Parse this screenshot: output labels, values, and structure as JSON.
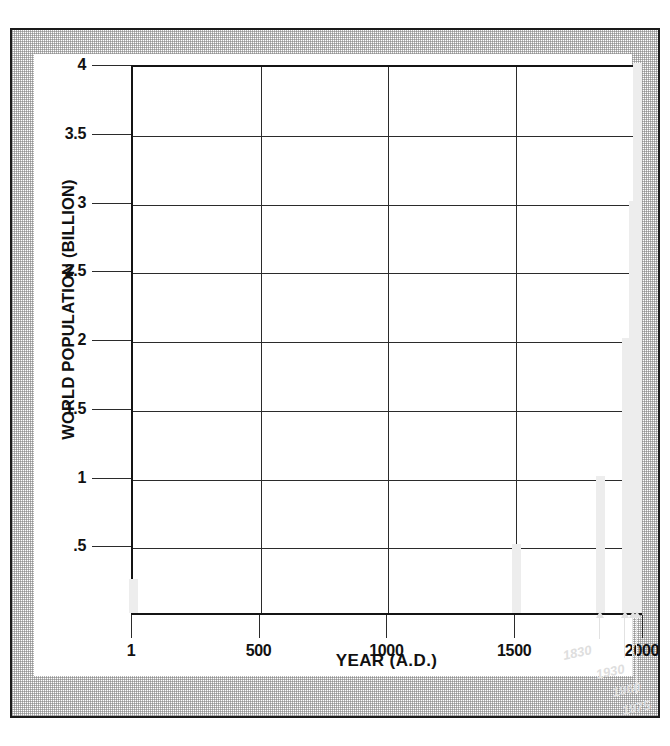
{
  "figure": {
    "alt_title": "World population growth over time"
  },
  "chart_data": {
    "type": "bar",
    "title": "",
    "xlabel": "YEAR (A.D.)",
    "ylabel": "WORLD POPULATION (BILLION)",
    "xlim": [
      1,
      2000
    ],
    "ylim": [
      0,
      4
    ],
    "grid": true,
    "legend": "none",
    "x_ticks": [
      "1",
      "500",
      "1000",
      "1500",
      "2000"
    ],
    "x_tick_values": [
      1,
      500,
      1000,
      1500,
      2000
    ],
    "y_ticks": [
      ".5",
      "1",
      "1.5",
      "2",
      "2.5",
      "3",
      "3.5",
      "4"
    ],
    "y_tick_values": [
      0.5,
      1,
      1.5,
      2,
      2.5,
      3,
      3.5,
      4
    ],
    "categories": [
      1,
      1500,
      1830,
      1930,
      1960,
      1975
    ],
    "values": [
      0.25,
      0.5,
      1,
      2,
      3,
      4
    ],
    "bar_color": "#ededed",
    "axis_color": "#141414",
    "grid_color": "#2b2b2b",
    "bars": [
      {
        "year": 1,
        "label": "",
        "value": 0.25
      },
      {
        "year": 1500,
        "label": "",
        "value": 0.5
      },
      {
        "year": 1830,
        "label": "1830",
        "value": 1
      },
      {
        "year": 1930,
        "label": "1930",
        "value": 2
      },
      {
        "year": 1960,
        "label": "1960",
        "value": 3
      },
      {
        "year": 1975,
        "label": "1975",
        "value": 4
      }
    ],
    "annotations": [
      {
        "text": "1830",
        "year": 1830
      },
      {
        "text": "1930",
        "year": 1930
      },
      {
        "text": "1960",
        "year": 1960
      },
      {
        "text": "1975",
        "year": 1975
      }
    ]
  }
}
